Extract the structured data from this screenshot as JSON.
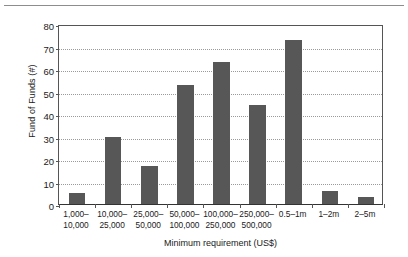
{
  "figure": {
    "name": "fund-of-funds-minimum-requirement-histogram",
    "top_rule": true
  },
  "chart_data": {
    "type": "bar",
    "title": "",
    "xlabel": "Minimum requirement (US$)",
    "ylabel": "Fund of Funds (#)",
    "categories": [
      "1,000–\n10,000",
      "10,000–\n25,000",
      "25,000–\n50,000",
      "50,000–\n100,000",
      "100,000–\n250,000",
      "250,000–\n500,000",
      "0.5–1m",
      "1–2m",
      "2–5m"
    ],
    "category_lines": [
      [
        "1,000–",
        "10,000"
      ],
      [
        "10,000–",
        "25,000"
      ],
      [
        "25,000–",
        "50,000"
      ],
      [
        "50,000–",
        "100,000"
      ],
      [
        "100,000–",
        "250,000"
      ],
      [
        "250,000–",
        "500,000"
      ],
      [
        "0.5–1m",
        ""
      ],
      [
        "1–2m",
        ""
      ],
      [
        "2–5m",
        ""
      ]
    ],
    "values": [
      5,
      30,
      17,
      53,
      63,
      44,
      73,
      6,
      3
    ],
    "ylim": [
      0,
      80
    ],
    "ytick_values": [
      0,
      10,
      20,
      30,
      40,
      50,
      60,
      70,
      80
    ],
    "ytick_labels": [
      "0",
      "10",
      "20",
      "30",
      "40",
      "50",
      "60",
      "70",
      "80"
    ],
    "grid": true,
    "grid_axis": "y",
    "grid_style": "dotted",
    "legend": null,
    "bar_color": "#575757",
    "grid_color": "#9a9a9a",
    "axis_color": "#555555",
    "background": "#ffffff"
  }
}
